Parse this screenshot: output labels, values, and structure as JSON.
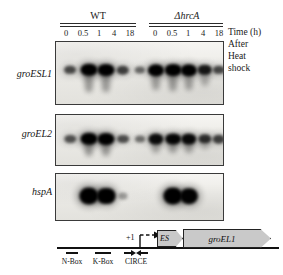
{
  "figure": {
    "type": "northern-blot-with-gene-map",
    "background": "#ffffff"
  },
  "header": {
    "groups": [
      {
        "label": "WT",
        "italic": false
      },
      {
        "label": "ΔhrcA",
        "italic": true
      }
    ],
    "timepoints": [
      "0",
      "0.5",
      "1",
      "4",
      "18"
    ],
    "side_caption_lines": [
      "Time (h)",
      "After",
      "Heat",
      "shock"
    ]
  },
  "panels": [
    {
      "gene": "groESL1",
      "lanes": [
        {
          "timepoint": "0",
          "group": "WT",
          "intensity": 0.45
        },
        {
          "timepoint": "0.5",
          "group": "WT",
          "intensity": 1.0
        },
        {
          "timepoint": "1",
          "group": "WT",
          "intensity": 0.98
        },
        {
          "timepoint": "4",
          "group": "WT",
          "intensity": 0.5
        },
        {
          "timepoint": "18",
          "group": "WT",
          "intensity": 0.28
        },
        {
          "timepoint": "0",
          "group": "ΔhrcA",
          "intensity": 0.9
        },
        {
          "timepoint": "0.5",
          "group": "ΔhrcA",
          "intensity": 0.95
        },
        {
          "timepoint": "1",
          "group": "ΔhrcA",
          "intensity": 0.92
        },
        {
          "timepoint": "4",
          "group": "ΔhrcA",
          "intensity": 0.72
        },
        {
          "timepoint": "18",
          "group": "ΔhrcA",
          "intensity": 0.45
        }
      ]
    },
    {
      "gene": "groEL2",
      "lanes": [
        {
          "timepoint": "0",
          "group": "WT",
          "intensity": 0.4
        },
        {
          "timepoint": "0.5",
          "group": "WT",
          "intensity": 1.0
        },
        {
          "timepoint": "1",
          "group": "WT",
          "intensity": 0.98
        },
        {
          "timepoint": "4",
          "group": "WT",
          "intensity": 0.42
        },
        {
          "timepoint": "18",
          "group": "WT",
          "intensity": 0.24
        },
        {
          "timepoint": "0",
          "group": "ΔhrcA",
          "intensity": 0.8
        },
        {
          "timepoint": "0.5",
          "group": "ΔhrcA",
          "intensity": 0.85
        },
        {
          "timepoint": "1",
          "group": "ΔhrcA",
          "intensity": 0.82
        },
        {
          "timepoint": "4",
          "group": "ΔhrcA",
          "intensity": 0.58
        },
        {
          "timepoint": "18",
          "group": "ΔhrcA",
          "intensity": 0.5
        }
      ]
    },
    {
      "gene": "hspA",
      "lanes": [
        {
          "timepoint": "0",
          "group": "WT",
          "intensity": 0.0
        },
        {
          "timepoint": "0.5",
          "group": "WT",
          "intensity": 1.0
        },
        {
          "timepoint": "1",
          "group": "WT",
          "intensity": 0.92
        },
        {
          "timepoint": "4",
          "group": "WT",
          "intensity": 0.03
        },
        {
          "timepoint": "18",
          "group": "WT",
          "intensity": 0.0
        },
        {
          "timepoint": "0",
          "group": "ΔhrcA",
          "intensity": 0.0
        },
        {
          "timepoint": "0.5",
          "group": "ΔhrcA",
          "intensity": 1.0
        },
        {
          "timepoint": "1",
          "group": "ΔhrcA",
          "intensity": 0.88
        },
        {
          "timepoint": "4",
          "group": "ΔhrcA",
          "intensity": 0.0
        },
        {
          "timepoint": "18",
          "group": "ΔhrcA",
          "intensity": 0.0
        }
      ]
    }
  ],
  "gene_map": {
    "tss_label": "+1",
    "motifs": [
      {
        "label": "N-Box"
      },
      {
        "label": "K-Box"
      },
      {
        "label": "CIRCE"
      }
    ],
    "genes": [
      {
        "label": "ES"
      },
      {
        "label": "groEL1"
      }
    ],
    "gene_fill": "#c9c9c9"
  }
}
